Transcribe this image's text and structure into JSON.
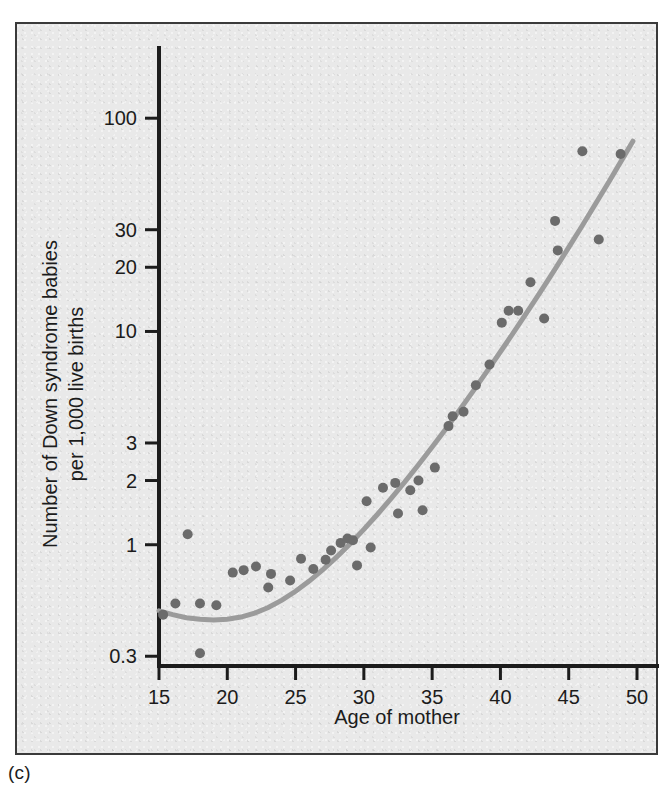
{
  "figure": {
    "caption": "(c)",
    "panel_bg": "#e9e9e9",
    "frame_color": "#3a3a3a"
  },
  "chart_data": {
    "type": "scatter",
    "title": "",
    "subtitle": "",
    "xlabel": "Age of mother",
    "ylabel_line1": "Number of Down syndrome babies",
    "ylabel_line2": "per 1,000 live births",
    "yscale": "log",
    "xscale": "linear",
    "xlim": [
      15,
      50
    ],
    "ylim": [
      0.27,
      200
    ],
    "grid": false,
    "legend": null,
    "xticks": [
      15,
      20,
      25,
      30,
      35,
      40,
      45,
      50
    ],
    "xticklabels": [
      "15",
      "20",
      "25",
      "30",
      "35",
      "40",
      "45",
      "50"
    ],
    "yticks": [
      0.3,
      1,
      2,
      3,
      10,
      20,
      30,
      100
    ],
    "yticklabels": [
      "0.3",
      "1",
      "2",
      "3",
      "10",
      "20",
      "30",
      "100"
    ],
    "point_color": "#6b6b6b",
    "point_radius": 5,
    "curve_color": "#9b9b9b",
    "curve_width": 5,
    "series": [
      {
        "name": "Down syndrome incidence by maternal age",
        "x": [
          15.3,
          16.2,
          17.1,
          18.0,
          18.0,
          19.2,
          20.4,
          21.2,
          22.1,
          23.0,
          23.2,
          24.6,
          25.4,
          26.3,
          27.2,
          27.6,
          28.3,
          28.8,
          29.2,
          29.5,
          30.2,
          30.5,
          31.4,
          32.3,
          32.5,
          33.4,
          34.0,
          34.3,
          35.2,
          36.2,
          36.5,
          37.3,
          38.2,
          39.2,
          40.1,
          40.6,
          41.3,
          42.2,
          43.2,
          44.0,
          44.2,
          46.0,
          47.2,
          48.8
        ],
        "y": [
          0.47,
          0.53,
          1.12,
          0.31,
          0.53,
          0.52,
          0.74,
          0.76,
          0.79,
          0.63,
          0.73,
          0.68,
          0.86,
          0.77,
          0.85,
          0.94,
          1.02,
          1.07,
          1.05,
          0.8,
          1.6,
          0.97,
          1.85,
          1.95,
          1.4,
          1.8,
          2.0,
          1.45,
          2.3,
          3.6,
          4.0,
          4.2,
          5.6,
          7.0,
          11.0,
          12.5,
          12.5,
          17.0,
          11.5,
          33.0,
          24.0,
          70.0,
          27.0,
          68.0
        ]
      }
    ],
    "fit_curve": {
      "name": "fitted exponential trend",
      "x": [
        15.0,
        16.0,
        17.0,
        18.0,
        19.0,
        20.0,
        21.0,
        22.0,
        23.0,
        24.0,
        25.0,
        26.0,
        27.0,
        28.0,
        29.0,
        30.0,
        31.0,
        32.0,
        33.0,
        34.0,
        35.0,
        36.0,
        37.0,
        38.0,
        39.0,
        40.0,
        41.0,
        42.0,
        43.0,
        44.0,
        45.0,
        46.0,
        47.0,
        48.0,
        49.0,
        49.7
      ],
      "y": [
        0.49,
        0.47,
        0.455,
        0.447,
        0.444,
        0.447,
        0.458,
        0.478,
        0.508,
        0.55,
        0.605,
        0.675,
        0.765,
        0.875,
        1.01,
        1.18,
        1.39,
        1.65,
        1.97,
        2.37,
        2.87,
        3.49,
        4.27,
        5.25,
        6.48,
        8.03,
        9.98,
        12.45,
        15.6,
        19.6,
        24.8,
        31.4,
        40.0,
        51.0,
        65.5,
        78.0
      ]
    }
  }
}
